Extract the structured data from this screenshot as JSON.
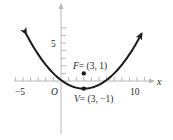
{
  "chart_data": {
    "type": "line",
    "title": "",
    "xlabel": "x",
    "ylabel": "",
    "equation": "(x - 3)^2 = 8(y + 1)",
    "xlim": [
      -6,
      11
    ],
    "ylim": [
      -7,
      9
    ],
    "x_tick_labels": [
      "-5",
      "10"
    ],
    "y_tick_labels": [
      "5"
    ],
    "origin_label": "O",
    "grid": false,
    "series": [
      {
        "name": "parabola",
        "x": [
          -4.6,
          -3,
          -1,
          1,
          3,
          5,
          7,
          9,
          10.6
        ],
        "y": [
          6.22,
          3.5,
          1.0,
          -0.5,
          -1.0,
          -0.5,
          1.0,
          3.5,
          6.22
        ]
      }
    ],
    "points": [
      {
        "name": "F",
        "label": "F = (3, 1)",
        "x": 3,
        "y": 1
      },
      {
        "name": "V",
        "label": "V = (3, −1)",
        "x": 3,
        "y": -1
      }
    ]
  },
  "labels": {
    "x_axis": "x",
    "tick_neg5": "−5",
    "tick_10": "10",
    "tick_5": "5",
    "origin": "O",
    "focus_name": "F",
    "focus_coords": "= (3, 1)",
    "vertex_name": "V",
    "vertex_coords": "= (3, −1)"
  },
  "colors": {
    "curve": "#1a1a1a",
    "axis": "#b8b8b8",
    "text": "#2a2a2a"
  }
}
